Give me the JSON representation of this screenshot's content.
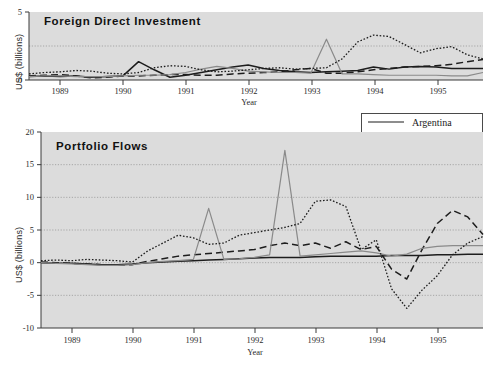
{
  "figure": {
    "width": 485,
    "height": 375,
    "background": "#ffffff",
    "plot_background": "#dcdcdc"
  },
  "legend": {
    "position": "upper-right-between-panels",
    "entries": [
      {
        "label": "Argentina",
        "style": "solid",
        "color": "#1d1d1d",
        "width": 1.5
      },
      {
        "label": "Brazil",
        "style": "dashed",
        "color": "#1d1d1d",
        "width": 1.5
      },
      {
        "label": "Chile",
        "style": "solid",
        "color": "#8a8a8a",
        "width": 1.2
      },
      {
        "label": "Mexico",
        "style": "dotted",
        "color": "#1d1d1d",
        "width": 1.3
      }
    ]
  },
  "chart_data": [
    {
      "id": "fdi",
      "type": "line",
      "title": "Foreign Direct Investment",
      "xlabel": "Year",
      "ylabel": "US$ (billions)",
      "grid": true,
      "legend_position": "shared-right",
      "xlim": [
        1988.5,
        1995.75
      ],
      "ylim": [
        0,
        5
      ],
      "yticks": [
        0,
        5
      ],
      "ygridlines": [
        2.5
      ],
      "ytick_labels": [
        "0",
        "5"
      ],
      "xticks": [
        1989,
        1990,
        1991,
        1992,
        1993,
        1994,
        1995
      ],
      "xtick_labels": [
        "1989",
        "1990",
        "1991",
        "1992",
        "1993",
        "1994",
        "1995"
      ],
      "x": [
        1988.5,
        1988.75,
        1989.0,
        1989.25,
        1989.5,
        1989.75,
        1990.0,
        1990.25,
        1990.5,
        1990.75,
        1991.0,
        1991.25,
        1991.5,
        1991.75,
        1992.0,
        1992.25,
        1992.5,
        1992.75,
        1993.0,
        1993.25,
        1993.5,
        1993.75,
        1994.0,
        1994.25,
        1994.5,
        1994.75,
        1995.0,
        1995.25,
        1995.5,
        1995.75
      ],
      "series": [
        {
          "name": "Argentina",
          "values": [
            0.25,
            0.3,
            0.25,
            0.3,
            0.2,
            0.25,
            0.3,
            1.35,
            0.75,
            0.2,
            0.35,
            0.55,
            0.75,
            0.95,
            1.1,
            0.85,
            0.7,
            0.6,
            0.55,
            0.6,
            0.65,
            0.7,
            0.95,
            0.8,
            0.95,
            1.0,
            0.95,
            0.85,
            0.85,
            0.85
          ]
        },
        {
          "name": "Brazil",
          "values": [
            0.3,
            0.35,
            0.4,
            0.3,
            0.15,
            0.2,
            0.3,
            0.3,
            0.35,
            0.4,
            0.4,
            0.35,
            0.35,
            0.45,
            0.5,
            0.55,
            0.6,
            0.75,
            0.85,
            0.5,
            0.5,
            0.6,
            0.75,
            0.85,
            0.95,
            1.0,
            1.05,
            1.15,
            1.35,
            1.5
          ]
        },
        {
          "name": "Chile",
          "values": [
            0.25,
            0.3,
            0.3,
            0.25,
            0.25,
            0.25,
            0.3,
            0.35,
            0.35,
            0.4,
            0.55,
            0.8,
            1.0,
            0.85,
            0.65,
            0.6,
            0.55,
            0.55,
            0.5,
            3.0,
            0.45,
            0.45,
            0.4,
            0.35,
            0.35,
            0.35,
            0.35,
            0.3,
            0.3,
            0.55
          ]
        },
        {
          "name": "Mexico",
          "values": [
            0.45,
            0.55,
            0.6,
            0.7,
            0.65,
            0.5,
            0.45,
            0.55,
            0.9,
            1.05,
            1.0,
            0.75,
            0.6,
            0.65,
            0.75,
            0.85,
            0.9,
            0.8,
            0.85,
            0.9,
            1.55,
            2.8,
            3.3,
            3.2,
            2.6,
            2.0,
            2.3,
            2.45,
            1.85,
            1.55
          ]
        }
      ]
    },
    {
      "id": "portfolio",
      "type": "line",
      "title": "Portfolio Flows",
      "xlabel": "Year",
      "ylabel": "US$ (billions)",
      "grid": true,
      "legend_position": "shared-right",
      "xlim": [
        1988.5,
        1995.75
      ],
      "ylim": [
        -10,
        20
      ],
      "yticks": [
        -10,
        -5,
        0,
        5,
        10,
        15,
        20
      ],
      "ygridlines": [
        -5,
        0,
        5,
        10,
        15
      ],
      "ytick_labels": [
        "-10",
        "-5",
        "0",
        "5",
        "10",
        "15",
        "20"
      ],
      "xticks": [
        1989,
        1990,
        1991,
        1992,
        1993,
        1994,
        1995
      ],
      "xtick_labels": [
        "1989",
        "1990",
        "1991",
        "1992",
        "1993",
        "1994",
        "1995"
      ],
      "x": [
        1988.5,
        1988.75,
        1989.0,
        1989.25,
        1989.5,
        1989.75,
        1990.0,
        1990.25,
        1990.5,
        1990.75,
        1991.0,
        1991.25,
        1991.5,
        1991.75,
        1992.0,
        1992.25,
        1992.5,
        1992.75,
        1993.0,
        1993.25,
        1993.5,
        1993.75,
        1994.0,
        1994.25,
        1994.5,
        1994.75,
        1995.0,
        1995.25,
        1995.5,
        1995.75
      ],
      "series": [
        {
          "name": "Argentina",
          "values": [
            0.0,
            -0.1,
            -0.1,
            -0.2,
            -0.3,
            -0.3,
            -0.2,
            0.0,
            0.1,
            0.2,
            0.3,
            0.4,
            0.5,
            0.6,
            0.7,
            0.8,
            0.8,
            0.8,
            0.9,
            1.0,
            1.0,
            1.0,
            1.0,
            1.1,
            1.1,
            1.1,
            1.2,
            1.2,
            1.3,
            1.3
          ]
        },
        {
          "name": "Brazil",
          "values": [
            0.1,
            0.0,
            -0.1,
            -0.2,
            -0.3,
            -0.4,
            -0.3,
            0.2,
            0.6,
            1.0,
            1.2,
            1.4,
            1.6,
            1.8,
            2.0,
            2.6,
            3.0,
            2.6,
            3.0,
            2.2,
            3.2,
            2.0,
            2.5,
            -1.0,
            -2.5,
            2.0,
            6.0,
            8.0,
            7.0,
            4.3
          ]
        },
        {
          "name": "Chile",
          "values": [
            0.0,
            -0.1,
            -0.2,
            -0.3,
            -0.4,
            -0.4,
            -0.3,
            0.0,
            0.2,
            0.3,
            0.5,
            8.3,
            0.5,
            0.6,
            0.8,
            1.2,
            17.2,
            1.0,
            1.2,
            1.4,
            1.6,
            1.8,
            1.5,
            1.0,
            1.3,
            2.2,
            2.5,
            2.6,
            2.6,
            2.6
          ]
        },
        {
          "name": "Mexico",
          "values": [
            0.3,
            0.4,
            0.3,
            0.5,
            0.4,
            0.3,
            0.1,
            1.8,
            3.0,
            4.2,
            3.8,
            2.8,
            3.0,
            4.2,
            4.6,
            5.0,
            5.4,
            6.0,
            9.4,
            9.6,
            8.6,
            2.0,
            3.5,
            -4.0,
            -7.0,
            -4.2,
            -2.0,
            1.2,
            3.0,
            4.0
          ]
        }
      ]
    }
  ]
}
